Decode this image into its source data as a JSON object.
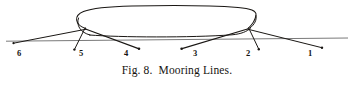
{
  "figure": {
    "caption": "Fig. 8.  Mooring Lines.",
    "caption_number": "Fig. 8.",
    "caption_title": "Mooring Lines.",
    "ink_color": "#1a1714",
    "waterline_color": "#6f6f6f",
    "background_color": "#ffffff"
  },
  "diagram": {
    "type": "line-drawing",
    "vessel": {
      "name": "ship-hull",
      "deck_outline": "rounded-rectangle",
      "bow_side": "left",
      "stern_side": "right"
    },
    "waterline": {
      "name": "quay-waterline",
      "x1": 6,
      "y1": 41,
      "x2": 348,
      "y2": 38
    },
    "mooring_lines": [
      {
        "label": "6",
        "label_x": 20,
        "label_y": 55,
        "ship_x": 86,
        "ship_y": 29,
        "anchor_x": 13,
        "anchor_y": 43,
        "type": "head-line"
      },
      {
        "label": "5",
        "label_x": 81,
        "label_y": 55,
        "ship_x": 85,
        "ship_y": 28,
        "anchor_x": 75,
        "anchor_y": 50,
        "type": "breast-line"
      },
      {
        "label": "4",
        "label_x": 126,
        "label_y": 55,
        "ship_x": 85,
        "ship_y": 29,
        "anchor_x": 140,
        "anchor_y": 50,
        "type": "forward-spring"
      },
      {
        "label": "3",
        "label_x": 195,
        "label_y": 55,
        "ship_x": 248,
        "ship_y": 29,
        "anchor_x": 181,
        "anchor_y": 50,
        "type": "after-spring"
      },
      {
        "label": "2",
        "label_x": 248,
        "label_y": 55,
        "ship_x": 249,
        "ship_y": 28,
        "anchor_x": 258,
        "anchor_y": 50,
        "type": "breast-line"
      },
      {
        "label": "1",
        "label_x": 310,
        "label_y": 55,
        "ship_x": 248,
        "ship_y": 29,
        "anchor_x": 322,
        "anchor_y": 49,
        "type": "stern-line"
      }
    ]
  }
}
